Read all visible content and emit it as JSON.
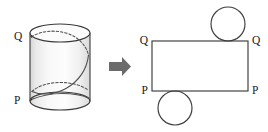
{
  "figure": {
    "background_color": "#ffffff",
    "stroke_color": "#4d4d4d",
    "label_color": "#1a1a1a"
  },
  "left_diagram": {
    "name": "cylinder-with-helix",
    "shape": "cylinder",
    "curve": "helix",
    "labels": {
      "top": "Q",
      "bottom": "P"
    },
    "geometry": {
      "left": 30,
      "right": 90,
      "top": 24,
      "bottom": 110,
      "ellipse_rx": 30,
      "ellipse_ry": 9
    }
  },
  "arrow": {
    "name": "transform-arrow",
    "direction": "right",
    "color": "#6b6b6b"
  },
  "right_diagram": {
    "name": "cylinder-net",
    "shape": "rectangle-with-two-circles",
    "labels": {
      "top_left": "Q",
      "top_right": "Q",
      "bottom_left": "P",
      "bottom_right": "P"
    },
    "geometry": {
      "rect_x": 152,
      "rect_y": 41,
      "rect_width": 96,
      "rect_height": 50,
      "top_circle_cx": 228,
      "top_circle_cy": 24,
      "bottom_circle_cx": 175,
      "bottom_circle_cy": 108,
      "circle_r": 17
    }
  }
}
